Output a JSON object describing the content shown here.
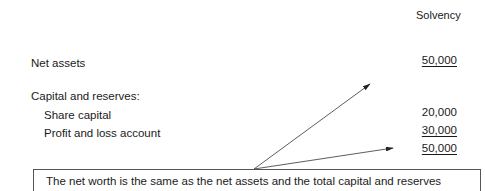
{
  "header": {
    "column_label": "Solvency"
  },
  "rows": {
    "net_assets": {
      "label": "Net assets",
      "value": "50,000"
    },
    "capital_heading": {
      "label": "Capital and reserves:"
    },
    "share_capital": {
      "label": "Share capital",
      "value": "20,000"
    },
    "profit_loss": {
      "label": "Profit and loss account",
      "value": "30,000"
    },
    "total": {
      "value": "50,000"
    }
  },
  "callout": {
    "text": "The net worth is the same as the net assets and the total capital and reserves"
  },
  "colors": {
    "text": "#1a1a1a",
    "border": "#555555",
    "arrow": "#222222"
  }
}
